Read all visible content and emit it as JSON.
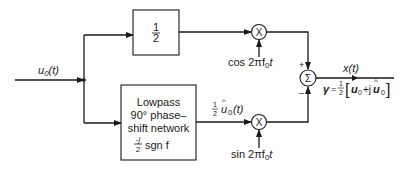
{
  "diagram": {
    "input": {
      "label_base": "u",
      "label_sub": "0",
      "label_arg": "(t)"
    },
    "top_block": {
      "numerator": "1",
      "denominator": "2"
    },
    "bottom_block": {
      "lines": [
        "Lowpass",
        "90° phase–",
        "shift network"
      ],
      "transfer_num": "-j",
      "transfer_den": "2",
      "transfer_rest": "sgn f"
    },
    "top_multiplier": {
      "symbol": "X",
      "carrier": "cos 2πf",
      "carrier_sub": "0",
      "carrier_t": "t"
    },
    "bottom_multiplier": {
      "symbol": "X",
      "carrier": "sin 2πf",
      "carrier_sub": "0",
      "carrier_t": "t"
    },
    "hilbert_signal": {
      "coef_num": "1",
      "coef_den": "2",
      "hat": "^",
      "base": "u",
      "sub": "0",
      "arg": "(t)"
    },
    "summer": {
      "symbol": "Σ",
      "plus_sign": "+",
      "minus_sign": "–"
    },
    "output": {
      "label": "x(t)",
      "gamma": "γ",
      "equals": "=",
      "coef_num": "1",
      "coef_den": "2",
      "bracket_open": "[",
      "term1": "u",
      "term1_sub": "0",
      "plus_j": "+j",
      "term2": "u",
      "term2_hat": "^",
      "term2_sub": "0",
      "bracket_close": "]"
    },
    "colors": {
      "ink": "#1a1a1a",
      "background": "#ffffff"
    }
  }
}
